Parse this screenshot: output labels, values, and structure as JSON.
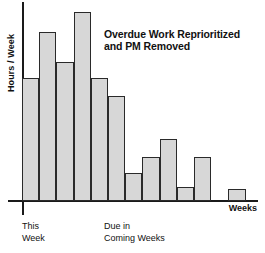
{
  "chart_data": {
    "type": "bar",
    "title": "Overdue Work Reprioritized and PM Removed",
    "title_line1": "Overdue Work Reprioritized",
    "title_line2": "and PM Removed",
    "xlabel": "Weeks",
    "ylabel": "Hours / Week",
    "grid": false,
    "legend": null,
    "ylim": [
      0,
      100
    ],
    "xlim": [
      0,
      13
    ],
    "categories": [
      "1",
      "2",
      "3",
      "4",
      "5",
      "6",
      "7",
      "8",
      "9",
      "10",
      "11",
      "12",
      "13"
    ],
    "values": [
      62,
      85,
      70,
      95,
      62,
      53,
      14,
      22,
      31,
      7,
      22,
      0,
      6
    ],
    "axis_annotations": [
      {
        "label": "This\nWeek",
        "position": "left"
      },
      {
        "label": "Due in\nComing Weeks",
        "position": "center"
      }
    ],
    "bar_color": "#d7d7d7",
    "bar_edge_color": "#2a2a2a",
    "axis_color": "#1a1a1a"
  },
  "labels": {
    "ylabel": "Hours / Week",
    "xlabel": "Weeks",
    "this_week": "This\nWeek",
    "coming_weeks": "Due in\nComing Weeks",
    "annotation_line1": "Overdue Work Reprioritized",
    "annotation_line2": "and PM Removed"
  }
}
